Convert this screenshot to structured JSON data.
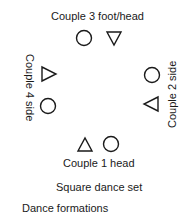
{
  "diagram": {
    "couples": {
      "couple3": {
        "label": "Couple 3 foot/head"
      },
      "couple4": {
        "label": "Couple 4 side"
      },
      "couple2": {
        "label": "Couple 2 side"
      },
      "couple1": {
        "label": "Couple 1 head"
      }
    },
    "caption": "Square dance set",
    "section_title": "Dance formations",
    "legend": {
      "circle": "circle-shape",
      "triangle": "triangle-shape"
    }
  }
}
